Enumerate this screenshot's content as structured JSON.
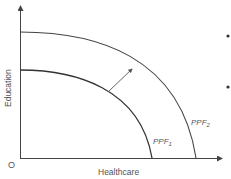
{
  "diagram": {
    "axes": {
      "x_label": "Healthcare",
      "y_label": "Education",
      "origin_label": "O"
    },
    "curves": [
      {
        "name": "PPF1",
        "label_main": "PPF",
        "label_sub": "1"
      },
      {
        "name": "PPF2",
        "label_main": "PPF",
        "label_sub": "2"
      }
    ],
    "arrow": {
      "from": "PPF1",
      "to": "PPF2",
      "meaning": "outward shift"
    },
    "bullets": [
      {
        "symbol": "•"
      },
      {
        "symbol": "•"
      }
    ],
    "colors": {
      "axis": "#444444",
      "curve": "#444444",
      "arrow": "#555555",
      "text": "#555555"
    }
  }
}
